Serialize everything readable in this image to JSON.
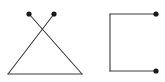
{
  "canvas": {
    "width": 165,
    "height": 82,
    "background_color": "#ffffff",
    "stroke_color": "#3a3a3a",
    "dot_color": "#1a1a1a",
    "stroke_width": 1.1,
    "dot_radius": 2.6
  },
  "figures": [
    {
      "name": "crossed-triangle",
      "description": "Triangle with two upper strokes crossing above the apex, each terminating in a dot",
      "vertices": {
        "left_dot": [
          29,
          14
        ],
        "right_dot": [
          54,
          14
        ],
        "crossing_point": [
          42,
          29
        ],
        "bottom_left": [
          8,
          74
        ],
        "bottom_right": [
          82,
          74
        ]
      },
      "segments": [
        {
          "name": "left-dot-to-bottom-right",
          "from": [
            29,
            14
          ],
          "to": [
            82,
            74
          ]
        },
        {
          "name": "right-dot-to-bottom-left",
          "from": [
            54,
            14
          ],
          "to": [
            8,
            74
          ]
        },
        {
          "name": "base-line",
          "from": [
            8,
            74
          ],
          "to": [
            82,
            74
          ]
        }
      ],
      "dots": [
        {
          "name": "left-endpoint-dot",
          "at": [
            29,
            14
          ]
        },
        {
          "name": "right-endpoint-dot",
          "at": [
            54,
            14
          ]
        }
      ]
    },
    {
      "name": "open-square-bracket",
      "description": "Three sides of a square open on the right, each free end terminating in a dot",
      "vertices": {
        "top_right_dot": [
          156,
          14
        ],
        "top_left_corner": [
          110,
          14
        ],
        "bottom_left_corner": [
          110,
          71
        ],
        "bottom_right_dot": [
          156,
          71
        ]
      },
      "segments": [
        {
          "name": "top-edge",
          "from": [
            156,
            14
          ],
          "to": [
            110,
            14
          ]
        },
        {
          "name": "left-edge",
          "from": [
            110,
            14
          ],
          "to": [
            110,
            71
          ]
        },
        {
          "name": "bottom-edge",
          "from": [
            110,
            71
          ],
          "to": [
            156,
            71
          ]
        }
      ],
      "dots": [
        {
          "name": "top-right-endpoint-dot",
          "at": [
            156,
            14
          ]
        },
        {
          "name": "bottom-right-endpoint-dot",
          "at": [
            156,
            71
          ]
        }
      ]
    }
  ]
}
